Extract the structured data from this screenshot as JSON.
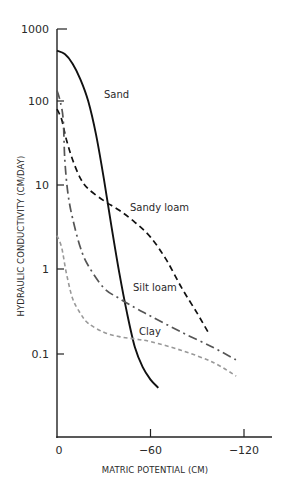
{
  "chart_data": {
    "type": "line",
    "title": "",
    "xlabel": "MATRIC POTENTIAL (CM)",
    "ylabel": "HYDRAULIC CONDUCTIVITY (CM/DAY)",
    "yscale": "log",
    "xlim": [
      0,
      -130
    ],
    "ylim": [
      0.02,
      1000
    ],
    "grid": false,
    "legend": "inline labels",
    "x_ticks": [
      0,
      -60,
      -120
    ],
    "x_tick_labels": [
      "0",
      "−60",
      "−120"
    ],
    "y_ticks": [
      1000,
      100,
      10,
      1,
      0.1
    ],
    "y_tick_labels": [
      "1000",
      "100",
      "10",
      "1",
      "0.1"
    ],
    "series": [
      {
        "name": "Sand",
        "style": "solid",
        "color": "#111111",
        "x": [
          0,
          -5,
          -10,
          -15,
          -20,
          -25,
          -30,
          -35,
          -40,
          -45,
          -50,
          -55,
          -60,
          -65
        ],
        "y": [
          500,
          450,
          330,
          200,
          100,
          40,
          12,
          3.2,
          0.9,
          0.3,
          0.12,
          0.07,
          0.05,
          0.04
        ]
      },
      {
        "name": "Sandy loam",
        "style": "dashed",
        "color": "#111111",
        "x": [
          0,
          -3,
          -6,
          -10,
          -15,
          -20,
          -30,
          -40,
          -50,
          -60,
          -70,
          -80,
          -90,
          -97
        ],
        "y": [
          80,
          60,
          35,
          20,
          12,
          9,
          6.5,
          5.0,
          3.6,
          2.4,
          1.3,
          0.6,
          0.3,
          0.18
        ]
      },
      {
        "name": "Silt loam",
        "style": "dash-dot",
        "color": "#555555",
        "x": [
          0,
          -2,
          -4,
          -5,
          -7,
          -10,
          -15,
          -20,
          -30,
          -40,
          -50,
          -60,
          -80,
          -100,
          -115
        ],
        "y": [
          140,
          100,
          60,
          20,
          8,
          4,
          1.8,
          1.1,
          0.6,
          0.45,
          0.35,
          0.28,
          0.18,
          0.12,
          0.085
        ]
      },
      {
        "name": "Clay",
        "style": "dotted",
        "color": "#999999",
        "x": [
          0,
          -3,
          -6,
          -10,
          -15,
          -20,
          -30,
          -40,
          -50,
          -60,
          -80,
          -100,
          -115
        ],
        "y": [
          2.5,
          1.8,
          0.9,
          0.45,
          0.3,
          0.23,
          0.18,
          0.16,
          0.15,
          0.14,
          0.11,
          0.08,
          0.055
        ]
      }
    ],
    "annotations": [
      {
        "text": "Sand",
        "at_px": [
          104,
          98
        ]
      },
      {
        "text": "Sandy loam",
        "at_px": [
          130,
          211
        ]
      },
      {
        "text": "Silt loam",
        "at_px": [
          133,
          291
        ]
      },
      {
        "text": "Clay",
        "at_px": [
          139,
          335
        ]
      }
    ]
  }
}
